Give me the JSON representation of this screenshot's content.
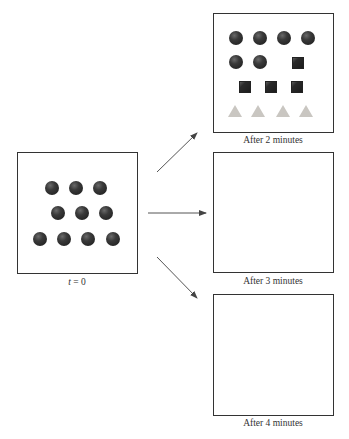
{
  "diagram": {
    "initial_panel": {
      "label_var": "t",
      "label_rest": " = 0",
      "shapes": [
        {
          "type": "circle",
          "x": 52,
          "y": 188
        },
        {
          "type": "circle",
          "x": 76,
          "y": 188
        },
        {
          "type": "circle",
          "x": 100,
          "y": 188
        },
        {
          "type": "circle",
          "x": 58,
          "y": 213
        },
        {
          "type": "circle",
          "x": 82,
          "y": 213
        },
        {
          "type": "circle",
          "x": 106,
          "y": 213
        },
        {
          "type": "circle",
          "x": 40,
          "y": 239
        },
        {
          "type": "circle",
          "x": 64,
          "y": 239
        },
        {
          "type": "circle",
          "x": 88,
          "y": 239
        },
        {
          "type": "circle",
          "x": 113,
          "y": 239
        }
      ]
    },
    "panels": [
      {
        "label": "After 2 minutes",
        "shapes": [
          {
            "type": "circle",
            "x": 236,
            "y": 38
          },
          {
            "type": "circle",
            "x": 260,
            "y": 38
          },
          {
            "type": "circle",
            "x": 284,
            "y": 38
          },
          {
            "type": "circle",
            "x": 308,
            "y": 38
          },
          {
            "type": "circle",
            "x": 236,
            "y": 62
          },
          {
            "type": "circle",
            "x": 260,
            "y": 62
          },
          {
            "type": "square",
            "x": 298,
            "y": 63
          },
          {
            "type": "square",
            "x": 245,
            "y": 87
          },
          {
            "type": "square",
            "x": 271,
            "y": 87
          },
          {
            "type": "square",
            "x": 297,
            "y": 87
          },
          {
            "type": "triangle",
            "x": 235,
            "y": 111
          },
          {
            "type": "triangle",
            "x": 258,
            "y": 111
          },
          {
            "type": "triangle",
            "x": 283,
            "y": 111
          },
          {
            "type": "triangle",
            "x": 306,
            "y": 111
          }
        ]
      },
      {
        "label": "After 3 minutes",
        "shapes": []
      },
      {
        "label": "After 4 minutes",
        "shapes": []
      }
    ],
    "colors": {
      "border": "#333333",
      "circle": "#2a2a2a",
      "square": "#1f1f1f",
      "triangle": "#c9c6c1",
      "arrow": "#444444"
    }
  }
}
